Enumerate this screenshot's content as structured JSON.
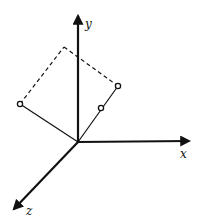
{
  "diagram": {
    "type": "3d-coordinate-axes",
    "colors": {
      "line": "#111111",
      "background": "#ffffff"
    },
    "origin": [
      78,
      142
    ],
    "axes": [
      {
        "name": "x",
        "label": "x",
        "tip": [
          191,
          141
        ],
        "label_pos": [
          180,
          158
        ]
      },
      {
        "name": "y",
        "label": "y",
        "tip": [
          78,
          14
        ],
        "label_pos": [
          85,
          28
        ]
      },
      {
        "name": "z",
        "label": "z",
        "tip": [
          12,
          211
        ],
        "label_pos": [
          26,
          215
        ]
      }
    ],
    "points": [
      {
        "name": "left-point",
        "pos": [
          20,
          104
        ]
      },
      {
        "name": "upper-right-point",
        "pos": [
          118,
          86
        ]
      },
      {
        "name": "middle-point",
        "pos": [
          101,
          108
        ]
      }
    ],
    "dashed_corner": [
      64,
      47
    ]
  }
}
